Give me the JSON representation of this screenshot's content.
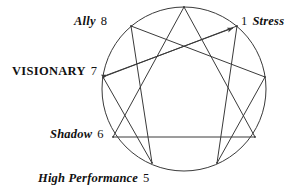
{
  "diagram": {
    "type": "enneagram",
    "background_color": "#ffffff",
    "stroke_color": "#3a3a3a",
    "text_color": "#111111",
    "circle": {
      "cx": 184,
      "cy": 89,
      "r": 82
    },
    "points": [
      {
        "id": "1",
        "number": "1",
        "x": 237,
        "y": 26
      },
      {
        "id": "2",
        "number": "2",
        "x": 265,
        "y": 77
      },
      {
        "id": "3",
        "number": "3",
        "x": 255,
        "y": 137
      },
      {
        "id": "4",
        "number": "4",
        "x": 217,
        "y": 163
      },
      {
        "id": "5",
        "number": "5",
        "x": 152,
        "y": 163
      },
      {
        "id": "6",
        "number": "6",
        "x": 113,
        "y": 137
      },
      {
        "id": "7",
        "number": "7",
        "x": 103,
        "y": 77
      },
      {
        "id": "8",
        "number": "8",
        "x": 131,
        "y": 26
      },
      {
        "id": "9",
        "number": "9",
        "x": 184,
        "y": 7
      }
    ],
    "triangle_path": "3-6-9",
    "hexad_path": "1-4-2-8-5-7",
    "arrow_line": {
      "from": "7",
      "to": "1",
      "head_at_start": true,
      "head_at_end": true,
      "description": "double-headed arrow between point 7 and point 1"
    },
    "labels": [
      {
        "id": "ally-8",
        "name": "Ally",
        "number": "8",
        "order": "name-then-number",
        "style": "bold-italic"
      },
      {
        "id": "stress-1",
        "name": "Stress",
        "number": "1",
        "order": "number-then-name",
        "style": "bold-italic"
      },
      {
        "id": "visionary-7",
        "name": "VISIONARY",
        "number": "7",
        "order": "name-then-number",
        "style": "bold-upright"
      },
      {
        "id": "shadow-6",
        "name": "Shadow",
        "number": "6",
        "order": "name-then-number",
        "style": "bold-italic"
      },
      {
        "id": "high-performance-5",
        "name": "High Performance",
        "number": "5",
        "order": "name-then-number",
        "style": "bold-italic"
      }
    ]
  }
}
